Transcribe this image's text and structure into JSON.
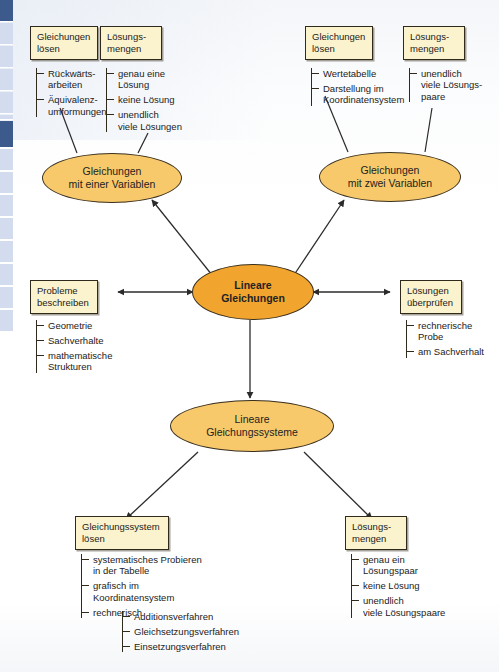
{
  "theme": {
    "node_fill": "#f7c96a",
    "center_fill": "#f2a52e",
    "box_fill": "#fbf3cd",
    "stroke": "#2f2a1c",
    "tab_inactive": "#d3dcee",
    "tab_active": "#3c5a8c"
  },
  "diagram": {
    "type": "concept-map",
    "title": "Lineare Gleichungen",
    "language": "de"
  },
  "nodes": {
    "center": {
      "line1": "Lineare",
      "line2": "Gleichungen"
    },
    "one_var": {
      "line1": "Gleichungen",
      "line2": "mit einer Variablen"
    },
    "two_var": {
      "line1": "Gleichungen",
      "line2": "mit zwei Variablen"
    },
    "systems": {
      "line1": "Lineare",
      "line2": "Gleichungssysteme"
    }
  },
  "boxes": {
    "solve_eq_left": {
      "line1": "Gleichungen",
      "line2": "lösen",
      "items": [
        "Rückwärts-\narbeiten",
        "Äquivalenz-\numformungen"
      ]
    },
    "solution_sets_left": {
      "line1": "Lösungs-",
      "line2": "mengen",
      "items": [
        "genau eine\nLösung",
        "keine Lösung",
        "unendlich\nviele Lösungen"
      ]
    },
    "solve_eq_right": {
      "line1": "Gleichungen",
      "line2": "lösen",
      "items": [
        "Wertetabelle",
        "Darstellung im\nKoordinatensystem"
      ]
    },
    "solution_sets_right": {
      "line1": "Lösungs-",
      "line2": "mengen",
      "items": [
        "unendlich\nviele Lösungs-\npaare"
      ]
    },
    "describe_problems": {
      "line1": "Probleme",
      "line2": "beschreiben",
      "items": [
        "Geometrie",
        "Sachverhalte",
        "mathematische\nStrukturen"
      ]
    },
    "check_solutions": {
      "line1": "Lösungen",
      "line2": "überprüfen",
      "items": [
        "rechnerische\nProbe",
        "am Sachverhalt"
      ]
    },
    "solve_system": {
      "line1": "Gleichungssystem",
      "line2": "lösen",
      "items": [
        "systematisches Probieren\nin der Tabelle",
        "grafisch im\nKoordinatensystem",
        "rechnerisch"
      ],
      "nested": [
        "Additionsverfahren",
        "Gleichsetzungsverfahren",
        "Einsetzungsverfahren"
      ]
    },
    "solution_sets_bottom": {
      "line1": "Lösungs-",
      "line2": "mengen",
      "items": [
        "genau ein\nLösungspaar",
        "keine Lösung",
        "unendlich\nviele Lösungspaare"
      ]
    }
  },
  "tabs": [
    {
      "active": true,
      "top": 0,
      "height": 22
    },
    {
      "active": false,
      "top": 23,
      "height": 22
    },
    {
      "active": false,
      "top": 46,
      "height": 22
    },
    {
      "active": false,
      "top": 69,
      "height": 22
    },
    {
      "active": false,
      "top": 92,
      "height": 22
    },
    {
      "active": false,
      "top": 115,
      "height": 5
    },
    {
      "active": true,
      "top": 121,
      "height": 27
    },
    {
      "active": false,
      "top": 149,
      "height": 22
    },
    {
      "active": false,
      "top": 172,
      "height": 22
    },
    {
      "active": false,
      "top": 195,
      "height": 22
    },
    {
      "active": false,
      "top": 218,
      "height": 22
    },
    {
      "active": false,
      "top": 241,
      "height": 22
    },
    {
      "active": false,
      "top": 264,
      "height": 22
    },
    {
      "active": false,
      "top": 287,
      "height": 22
    },
    {
      "active": false,
      "top": 310,
      "height": 22
    }
  ]
}
